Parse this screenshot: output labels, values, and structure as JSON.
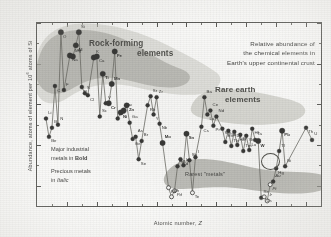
{
  "figure": {
    "title_lines": [
      "Relative abundance of",
      "the chemical elements in",
      "Earth's upper continental crust"
    ],
    "axis": {
      "ylabel_prefix": "Abundance, atoms of element per 10",
      "ylabel_exp": "6",
      "ylabel_suffix": " atoms of Si",
      "xlabel_prefix": "Atomic number, ",
      "xlabel_symbol": "Z"
    },
    "annotations": {
      "rock_forming_l1": "Rock-forming",
      "rock_forming_l2": "elements",
      "rare_earth_l1": "Rare earth",
      "rare_earth_l2": "elements",
      "rarest_metals": "Rarest  \"metals\"",
      "legend_l1": "Major industrial",
      "legend_l2_pre": "metals in ",
      "legend_l2_bold": "Bold",
      "legend_l3": "Precious metals",
      "legend_l4_pre": "in ",
      "legend_l4_italic": "Italic"
    },
    "colors": {
      "ink": "#4a4a48",
      "frame": "#5a5a57",
      "marker": "#3b3b39",
      "curve": "#6b6b64",
      "band_dark": "#9a9a92",
      "band_light": "#c3c3bb",
      "paper": "#fdfdfc"
    }
  },
  "chart_data": {
    "type": "scatter",
    "title": "Relative abundance of the chemical elements in Earth's upper continental crust",
    "xlabel": "Atomic number, Z",
    "ylabel": "Abundance, atoms of element per 10^6 atoms of Si",
    "xlim": [
      0,
      95
    ],
    "ylim_log10": [
      -3,
      6
    ],
    "xticks": [
      10,
      20,
      30,
      40,
      50,
      60,
      70,
      80,
      90
    ],
    "yticks": [
      "10⁶",
      "10⁴",
      "10²",
      "1",
      "10⁻²",
      "10⁻³"
    ],
    "ytick_log10": [
      6,
      4,
      2,
      0,
      -2,
      -3
    ],
    "grid": false,
    "legend": "none",
    "points": [
      {
        "z": 3,
        "el": "Li",
        "log": 1.3,
        "cls": "plain"
      },
      {
        "z": 4,
        "el": "Be",
        "log": 0.4,
        "cls": "plain"
      },
      {
        "z": 5,
        "el": "B",
        "log": 0.85,
        "cls": "plain"
      },
      {
        "z": 6,
        "el": "C",
        "log": 2.9,
        "cls": "plain"
      },
      {
        "z": 7,
        "el": "N",
        "log": 1.0,
        "cls": "plain"
      },
      {
        "z": 8,
        "el": "O",
        "log": 5.55,
        "cls": "big"
      },
      {
        "z": 9,
        "el": "F",
        "log": 2.7,
        "cls": "plain"
      },
      {
        "z": 11,
        "el": "Na",
        "log": 4.4,
        "cls": "big"
      },
      {
        "z": 12,
        "el": "Mg",
        "log": 4.35,
        "cls": "big"
      },
      {
        "z": 13,
        "el": "Al",
        "log": 4.9,
        "cls": "bigb"
      },
      {
        "z": 14,
        "el": "Si",
        "log": 5.55,
        "cls": "big"
      },
      {
        "z": 15,
        "el": "P",
        "log": 2.85,
        "cls": "plain"
      },
      {
        "z": 16,
        "el": "S",
        "log": 2.55,
        "cls": "plain"
      },
      {
        "z": 17,
        "el": "Cl",
        "log": 2.45,
        "cls": "plain"
      },
      {
        "z": 19,
        "el": "K",
        "log": 4.3,
        "cls": "big"
      },
      {
        "z": 20,
        "el": "Ca",
        "log": 4.35,
        "cls": "big"
      },
      {
        "z": 21,
        "el": "Sc",
        "log": 1.4,
        "cls": "plain"
      },
      {
        "z": 22,
        "el": "Ti",
        "log": 3.5,
        "cls": "bigb"
      },
      {
        "z": 23,
        "el": "V",
        "log": 2.05,
        "cls": "plain"
      },
      {
        "z": 24,
        "el": "Cr",
        "log": 2.05,
        "cls": "bigb"
      },
      {
        "z": 25,
        "el": "Mn",
        "log": 3.0,
        "cls": "bigb"
      },
      {
        "z": 26,
        "el": "Fe",
        "log": 4.6,
        "cls": "bigb"
      },
      {
        "z": 27,
        "el": "Co",
        "log": 1.3,
        "cls": "plain"
      },
      {
        "z": 28,
        "el": "Ni",
        "log": 1.6,
        "cls": "bigb"
      },
      {
        "z": 29,
        "el": "Cu",
        "log": 1.7,
        "cls": "bigb"
      },
      {
        "z": 30,
        "el": "Zn",
        "log": 1.95,
        "cls": "bigb"
      },
      {
        "z": 31,
        "el": "Ga",
        "log": 1.1,
        "cls": "plain"
      },
      {
        "z": 32,
        "el": "Ge",
        "log": 0.3,
        "cls": "plain"
      },
      {
        "z": 33,
        "el": "As",
        "log": 0.4,
        "cls": "plain"
      },
      {
        "z": 34,
        "el": "Se",
        "log": -0.7,
        "cls": "plain"
      },
      {
        "z": 35,
        "el": "Br",
        "log": 0.2,
        "cls": "plain"
      },
      {
        "z": 37,
        "el": "Rb",
        "log": 1.95,
        "cls": "plain"
      },
      {
        "z": 38,
        "el": "Sr",
        "log": 2.4,
        "cls": "plain"
      },
      {
        "z": 39,
        "el": "Y",
        "log": 1.5,
        "cls": "plain"
      },
      {
        "z": 40,
        "el": "Zr",
        "log": 2.35,
        "cls": "plain"
      },
      {
        "z": 41,
        "el": "Nb",
        "log": 1.05,
        "cls": "plain"
      },
      {
        "z": 42,
        "el": "Mo",
        "log": 0.1,
        "cls": "bigb"
      },
      {
        "z": 44,
        "el": "Ru",
        "log": -2.1,
        "cls": "opi"
      },
      {
        "z": 45,
        "el": "Rh",
        "log": -2.55,
        "cls": "opi"
      },
      {
        "z": 46,
        "el": "Pd",
        "log": -2.25,
        "cls": "opi"
      },
      {
        "z": 47,
        "el": "Ag",
        "log": -1.05,
        "cls": "plaini"
      },
      {
        "z": 48,
        "el": "Cd",
        "log": -0.7,
        "cls": "plain"
      },
      {
        "z": 49,
        "el": "In",
        "log": -1.0,
        "cls": "plain"
      },
      {
        "z": 50,
        "el": "Sn",
        "log": 0.55,
        "cls": "bigb"
      },
      {
        "z": 51,
        "el": "Sb",
        "log": -0.75,
        "cls": "plain"
      },
      {
        "z": 52,
        "el": "Te",
        "log": -2.35,
        "cls": "op"
      },
      {
        "z": 53,
        "el": "I",
        "log": -0.6,
        "cls": "plain"
      },
      {
        "z": 55,
        "el": "Cs",
        "log": 0.9,
        "cls": "plain"
      },
      {
        "z": 56,
        "el": "Ba",
        "log": 2.35,
        "cls": "plain"
      },
      {
        "z": 57,
        "el": "La",
        "log": 1.5,
        "cls": "plain"
      },
      {
        "z": 58,
        "el": "Ce",
        "log": 1.7,
        "cls": "plain"
      },
      {
        "z": 59,
        "el": "Pr",
        "log": 0.95,
        "cls": "plain"
      },
      {
        "z": 60,
        "el": "Nd",
        "log": 1.4,
        "cls": "plain"
      },
      {
        "z": 62,
        "el": "Sm",
        "log": 0.8,
        "cls": "plain"
      },
      {
        "z": 63,
        "el": "Eu",
        "log": 0.15,
        "cls": "plain"
      },
      {
        "z": 64,
        "el": "Gd",
        "log": 0.7,
        "cls": "plain"
      },
      {
        "z": 65,
        "el": "Tb",
        "log": -0.05,
        "cls": "plain"
      },
      {
        "z": 66,
        "el": "Dy",
        "log": 0.65,
        "cls": "plain"
      },
      {
        "z": 67,
        "el": "Ho",
        "log": 0.0,
        "cls": "plain"
      },
      {
        "z": 68,
        "el": "Er",
        "log": 0.5,
        "cls": "plain"
      },
      {
        "z": 69,
        "el": "Tm",
        "log": -0.3,
        "cls": "plain"
      },
      {
        "z": 70,
        "el": "Yb",
        "log": 0.45,
        "cls": "plain"
      },
      {
        "z": 71,
        "el": "Lu",
        "log": -0.25,
        "cls": "plain"
      },
      {
        "z": 72,
        "el": "Hf",
        "log": 0.8,
        "cls": "plain"
      },
      {
        "z": 73,
        "el": "Ta",
        "log": 0.25,
        "cls": "plain"
      },
      {
        "z": 74,
        "el": "W",
        "log": 0.2,
        "cls": "bigb"
      },
      {
        "z": 75,
        "el": "Re",
        "log": -2.6,
        "cls": "plain"
      },
      {
        "z": 76,
        "el": "Os",
        "log": -2.55,
        "cls": "opi"
      },
      {
        "z": 77,
        "el": "Ir",
        "log": -2.75,
        "cls": "opi"
      },
      {
        "z": 78,
        "el": "Pt",
        "log": -1.95,
        "cls": "opi"
      },
      {
        "z": 79,
        "el": "Au",
        "log": -1.8,
        "cls": "plaini"
      },
      {
        "z": 80,
        "el": "Hg",
        "log": -1.15,
        "cls": "plain"
      },
      {
        "z": 81,
        "el": "Tl",
        "log": -0.3,
        "cls": "plain"
      },
      {
        "z": 82,
        "el": "Pb",
        "log": 0.7,
        "cls": "bigb"
      },
      {
        "z": 83,
        "el": "Bi",
        "log": -1.05,
        "cls": "plain"
      },
      {
        "z": 90,
        "el": "Th",
        "log": 0.85,
        "cls": "plain"
      },
      {
        "z": 92,
        "el": "U",
        "log": 0.25,
        "cls": "plain"
      }
    ]
  }
}
